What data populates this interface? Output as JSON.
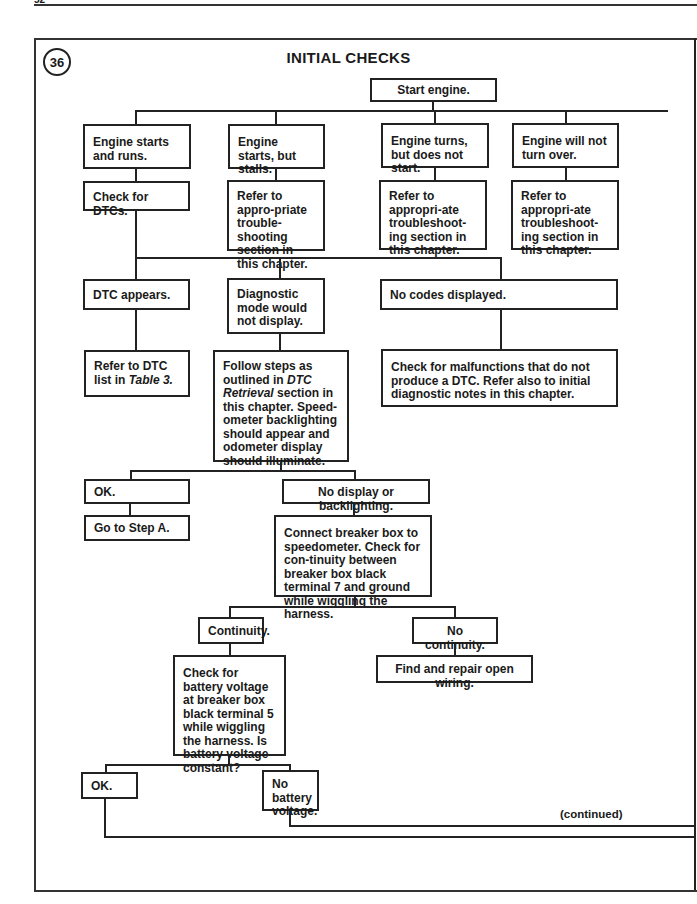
{
  "page": {
    "number": "52"
  },
  "figure": {
    "number": "36",
    "title": "INITIAL CHECKS"
  },
  "nodes": {
    "start": "Start engine.",
    "starts_runs": "Engine starts and runs.",
    "starts_stalls": "Engine starts, but stalls.",
    "turns_no_start": "Engine turns, but does not start.",
    "no_turn": "Engine will not turn over.",
    "check_dtcs": "Check for DTCs.",
    "refer_stalls": "Refer to appro-priate trouble-shooting section in this chapter.",
    "refer_no_start": "Refer to appropri-ate troubleshoot-ing section in this chapter.",
    "refer_no_turn": "Refer to appropri-ate troubleshoot-ing section in this chapter.",
    "dtc_appears": "DTC appears.",
    "diag_no_display": "Diagnostic mode would not display.",
    "no_codes": "No codes displayed.",
    "refer_dtc_list_prefix": "Refer to DTC list in ",
    "refer_dtc_list_table": "Table 3.",
    "follow_steps_prefix": "Follow steps as outlined in ",
    "follow_steps_italic": "DTC Retrieval",
    "follow_steps_suffix": " section in this chapter. Speed-ometer backlighting should appear and odometer display should illuminate.",
    "check_malfunctions": "Check for malfunctions that do not produce a DTC. Refer also to initial diagnostic notes in this chapter.",
    "ok_1": "OK.",
    "no_display": "No display or backlighting.",
    "go_step_a": "Go to Step A.",
    "connect_breaker": "Connect breaker box to speedometer. Check for con-tinuity between breaker box black terminal 7 and ground while wiggling the harness.",
    "continuity": "Continuity.",
    "no_continuity": "No continuity.",
    "check_battery": "Check for battery voltage at breaker box black terminal 5 while wiggling the harness. Is battery voltage constant?",
    "repair_wiring": "Find and repair open wiring.",
    "ok_2": "OK.",
    "no_battery": "No battery voltage."
  },
  "footer": {
    "continued": "(continued)"
  }
}
